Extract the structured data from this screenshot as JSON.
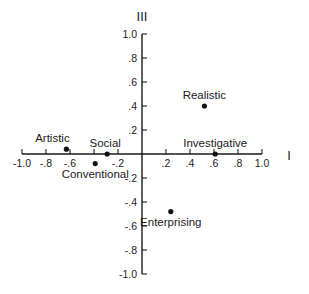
{
  "chart_data": {
    "type": "scatter",
    "title": "",
    "xlabel": "I",
    "ylabel": "III",
    "xlim": [
      -1.0,
      1.0
    ],
    "ylim": [
      -1.0,
      1.0
    ],
    "grid": false,
    "legend": null,
    "x_ticks": [
      -1.0,
      -0.8,
      -0.6,
      -0.4,
      -0.2,
      0.2,
      0.4,
      0.6,
      0.8,
      1.0
    ],
    "x_tick_labels": [
      "-1.0",
      "-.8",
      "-.6",
      "",
      "-.2",
      ".2",
      ".4",
      ".6",
      ".8",
      "1.0"
    ],
    "y_ticks": [
      1.0,
      0.8,
      0.6,
      0.4,
      0.2,
      -0.2,
      -0.4,
      -0.6,
      -0.8,
      -1.0
    ],
    "y_tick_labels": [
      "1.0",
      ".8",
      ".6",
      ".4",
      ".2",
      "-.2",
      "-.4",
      "-.6",
      "-.8",
      "-1.0"
    ],
    "points": [
      {
        "label": "Realistic",
        "x": 0.52,
        "y": 0.4,
        "label_pos": "above"
      },
      {
        "label": "Investigative",
        "x": 0.61,
        "y": 0.0,
        "label_pos": "above"
      },
      {
        "label": "Artistic",
        "x": -0.63,
        "y": 0.04,
        "label_pos": "above"
      },
      {
        "label": "Social",
        "x": -0.29,
        "y": 0.0,
        "label_pos": "above"
      },
      {
        "label": "Enterprising",
        "x": 0.24,
        "y": -0.48,
        "label_pos": "below"
      },
      {
        "label": "Conventional",
        "x": -0.39,
        "y": -0.08,
        "label_pos": "below"
      }
    ]
  },
  "axes": {
    "x_title": "I",
    "y_title": "III"
  },
  "colors": {
    "axis": "#1a1a1a",
    "point": "#111111",
    "background": "#ffffff"
  }
}
